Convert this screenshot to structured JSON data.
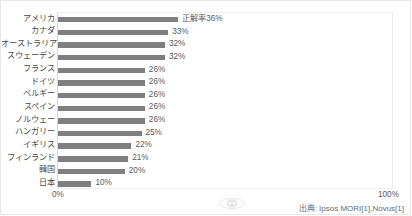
{
  "chart_data": {
    "type": "bar",
    "orientation": "horizontal",
    "title": "",
    "xlabel": "",
    "ylabel": "",
    "xlim": [
      0,
      100
    ],
    "grid": false,
    "legend": null,
    "categories": [
      "アメリカ",
      "カナダ",
      "オーストラリア",
      "スウェーデン",
      "フランス",
      "ドイツ",
      "ベルギー",
      "スペイン",
      "ノルウェー",
      "ハンガリー",
      "イギリス",
      "フィンランド",
      "韓国",
      "日本"
    ],
    "values": [
      36,
      33,
      32,
      32,
      26,
      26,
      26,
      26,
      26,
      25,
      22,
      21,
      20,
      10
    ],
    "data_labels": [
      "正解率36%",
      "33%",
      "32%",
      "32%",
      "26%",
      "26%",
      "26%",
      "26%",
      "26%",
      "25%",
      "22%",
      "21%",
      "20%",
      "10%"
    ],
    "bar_color": "#7f7f7f",
    "axis": {
      "tick_labels": [
        "0%",
        "100%"
      ],
      "min_label": "0%",
      "max_label": "100%"
    }
  },
  "footer": {
    "source": "出典: Ipsos MORI[1],Novus[1]"
  }
}
